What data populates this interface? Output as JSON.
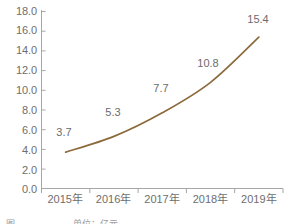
{
  "chart_data": {
    "type": "line",
    "title": "",
    "subtitle": "",
    "xlabel": "",
    "ylabel": "",
    "categories": [
      "2015年",
      "2016年",
      "2017年",
      "2018年",
      "2019年"
    ],
    "series": [
      {
        "name": "",
        "values": [
          3.7,
          5.3,
          7.7,
          10.8,
          15.4
        ]
      }
    ],
    "point_labels": [
      "3.7",
      "5.3",
      "7.7",
      "10.8",
      "15.4"
    ],
    "ylim": [
      0.0,
      18.0
    ],
    "ytick_step": 2.0,
    "ytick_labels": [
      "18.0",
      "16.0",
      "14.0",
      "12.0",
      "10.0",
      "8.0",
      "6.0",
      "4.0",
      "2.0",
      "0.0"
    ],
    "grid": false,
    "legend": "none",
    "line_color": "#8c6a3c",
    "axis_color": "#a6a6a6",
    "tick_text_color": "#6e6e6e",
    "label_text_color": "#6b6b6b",
    "background_color": "#ffffff"
  },
  "caption": {
    "mark": "图",
    "text": "单位：亿元"
  }
}
